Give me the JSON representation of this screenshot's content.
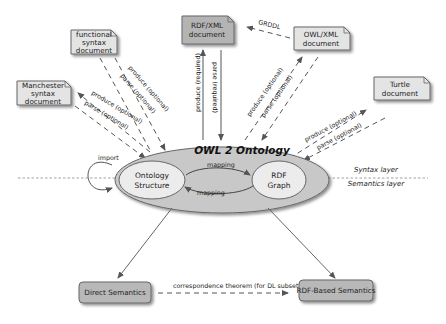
{
  "diagram": {
    "title": "OWL 2 Ontology",
    "inner_nodes": {
      "ontology_structure": [
        "Ontology",
        "Structure"
      ],
      "rdf_graph": [
        "RDF",
        "Graph"
      ]
    },
    "mapping_top": "mapping",
    "mapping_bottom": "mapping",
    "import_label": "import",
    "layers": {
      "syntax": "Syntax layer",
      "semantics": "Semantics layer"
    },
    "documents": {
      "functional": [
        "functional",
        "syntax",
        "document"
      ],
      "manchester": [
        "Manchester",
        "syntax",
        "document"
      ],
      "rdfxml": [
        "RDF/XML",
        "document"
      ],
      "owlxml": [
        "OWL/XML",
        "document"
      ],
      "turtle": [
        "Turtle",
        "document"
      ]
    },
    "edges": {
      "produce_optional": "produce (optional)",
      "parse_optional": "parse (optional)",
      "produce_required": "produce (required)",
      "parse_required": "parse (required)",
      "grddl": "GRDDL"
    },
    "semantics": {
      "direct": "Direct Semantics",
      "rdf_based": "RDF-Based Semantics",
      "correspondence": "correspondence theorem (for DL subset)"
    },
    "colors": {
      "doc_fill": "#e4e4e4",
      "rdfxml_fill": "#b4b4b4",
      "outer_ellipse": "#c8c8c8",
      "inner_ellipse": "#ececec",
      "semantics_fill": "#b8b8b8",
      "line": "#555555"
    }
  }
}
